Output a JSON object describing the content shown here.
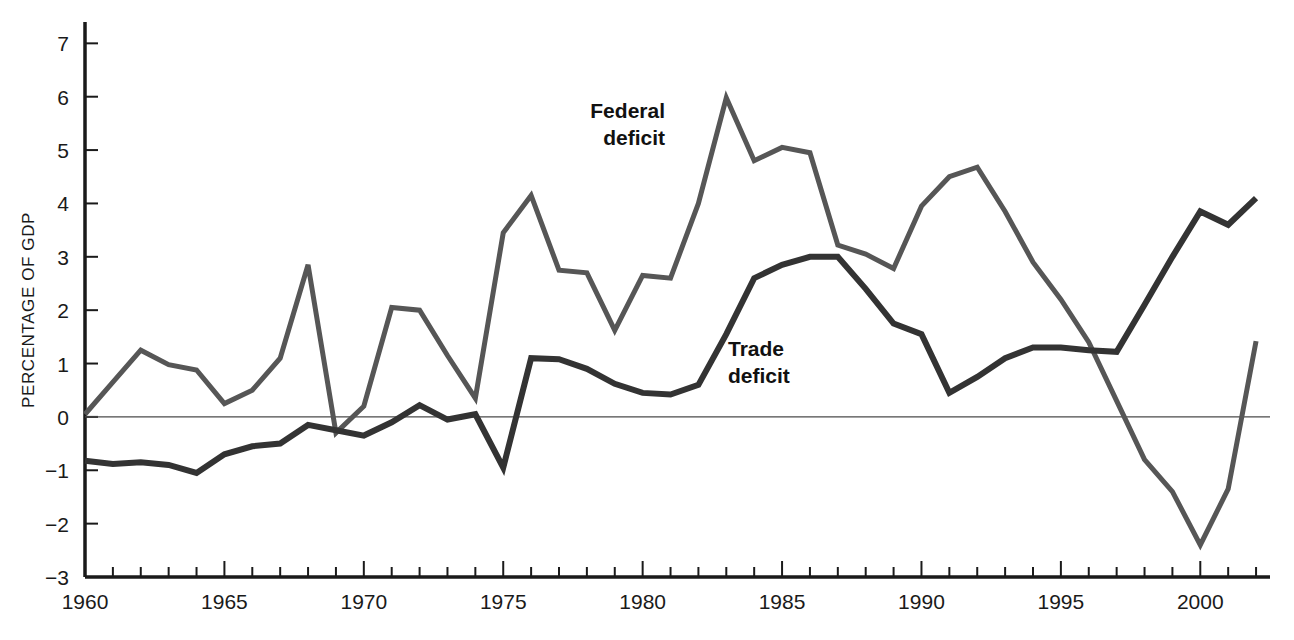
{
  "chart_data": {
    "type": "line",
    "title": "",
    "subtitle": "",
    "xlabel": "",
    "ylabel": "PERCENTAGE OF GDP",
    "xlim": [
      1960,
      2002.5
    ],
    "ylim": [
      -3,
      7.4
    ],
    "yticks": [
      -3,
      -2,
      -1,
      0,
      1,
      2,
      3,
      4,
      5,
      6,
      7
    ],
    "ytick_labels": [
      "−3",
      "−2",
      "−1",
      "0",
      "1",
      "2",
      "3",
      "4",
      "5",
      "6",
      "7"
    ],
    "xticks": [
      1960,
      1965,
      1970,
      1975,
      1980,
      1985,
      1990,
      1995,
      2000
    ],
    "xtick_labels": [
      "1960",
      "1965",
      "1970",
      "1975",
      "1980",
      "1985",
      "1990",
      "1995",
      "2000"
    ],
    "xminor_step": 1,
    "grid": false,
    "legend": "inline-annotations",
    "zero_line": true,
    "x": [
      1960,
      1961,
      1962,
      1963,
      1964,
      1965,
      1966,
      1967,
      1968,
      1969,
      1970,
      1971,
      1972,
      1973,
      1974,
      1975,
      1976,
      1977,
      1978,
      1979,
      1980,
      1981,
      1982,
      1983,
      1984,
      1985,
      1986,
      1987,
      1988,
      1989,
      1990,
      1991,
      1992,
      1993,
      1994,
      1995,
      1996,
      1997,
      1998,
      1999,
      2000,
      2001,
      2002
    ],
    "series": [
      {
        "name": "Federal deficit",
        "color": "#565656",
        "linewidth": 5,
        "label_position": {
          "x": 665,
          "y": 118,
          "anchor": "end"
        },
        "values": [
          0.05,
          0.65,
          1.25,
          0.98,
          0.88,
          0.25,
          0.5,
          1.1,
          2.85,
          -0.3,
          0.2,
          2.05,
          2.0,
          1.15,
          0.35,
          3.45,
          4.15,
          2.75,
          2.7,
          1.62,
          2.65,
          2.6,
          4.0,
          5.98,
          4.8,
          5.05,
          4.95,
          3.22,
          3.05,
          2.78,
          3.95,
          4.5,
          4.68,
          3.85,
          2.9,
          2.2,
          1.4,
          0.3,
          -0.8,
          -1.4,
          -2.4,
          -1.35,
          1.42
        ]
      },
      {
        "name": "Trade deficit",
        "color": "#333333",
        "linewidth": 6,
        "label_position": {
          "x": 728,
          "y": 356,
          "anchor": "start"
        },
        "values": [
          -0.82,
          -0.88,
          -0.85,
          -0.9,
          -1.05,
          -0.7,
          -0.55,
          -0.5,
          -0.15,
          -0.25,
          -0.35,
          -0.1,
          0.22,
          -0.05,
          0.05,
          -0.95,
          1.1,
          1.08,
          0.9,
          0.62,
          0.45,
          0.42,
          0.6,
          1.55,
          2.6,
          2.85,
          3.0,
          3.0,
          2.4,
          1.75,
          1.55,
          0.45,
          0.75,
          1.1,
          1.3,
          1.3,
          1.25,
          1.22,
          2.1,
          3.0,
          3.85,
          3.6,
          4.1
        ]
      }
    ]
  },
  "annotations": {
    "federal_label_line1": "Federal",
    "federal_label_line2": "deficit",
    "trade_label_line1": "Trade",
    "trade_label_line2": "deficit"
  }
}
